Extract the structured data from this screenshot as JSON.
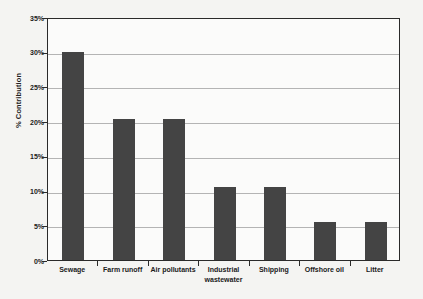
{
  "chart_data": {
    "type": "bar",
    "title": "",
    "xlabel": "",
    "ylabel": "% Contribution",
    "categories": [
      "Sewage",
      "Farm runoff",
      "Air pollutants",
      "Industrial wastewater",
      "Shipping",
      "Offshore oil",
      "Litter"
    ],
    "values": [
      30,
      20.3,
      20.3,
      10.5,
      10.5,
      5.5,
      5.5
    ],
    "ylim": [
      0,
      35
    ],
    "ytick_labels": [
      "0%",
      "5%",
      "10%",
      "15%",
      "20%",
      "25%",
      "30%",
      "35%"
    ],
    "ytick_values": [
      0,
      5,
      10,
      15,
      20,
      25,
      30,
      35
    ],
    "grid": true,
    "legend": false,
    "bar_color": "#444444",
    "gridline_color": "#b4b4b4",
    "axis_color": "#2a2a2a",
    "plot_background": "#fbfbfa",
    "figure_background": "#f4f4f2"
  }
}
